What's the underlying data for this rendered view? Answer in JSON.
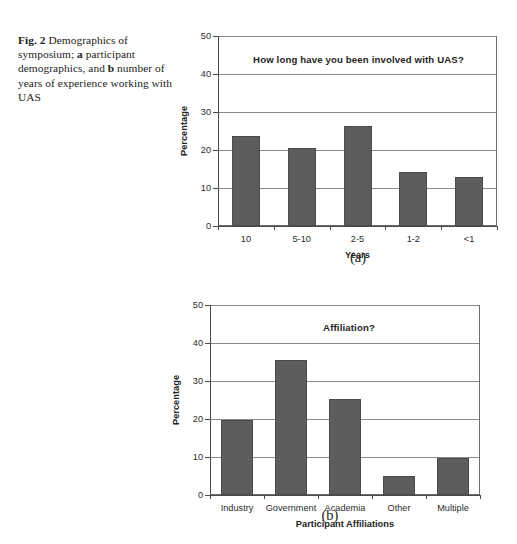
{
  "figure": {
    "caption_number": "Fig. 2",
    "caption_part1": "Demographics of symposium; ",
    "caption_a_letter": "a",
    "caption_part2": " participant demographics, and ",
    "caption_b_letter": "b",
    "caption_part3": " number of years of experience working with UAS",
    "bar_color": "#5d5d5d",
    "axis_color": "#4a4a4a",
    "grid_color": "#8a8a8a"
  },
  "panel_a": {
    "label": "(a)"
  },
  "panel_b": {
    "label": "(b)"
  },
  "chart_data": [
    {
      "type": "bar",
      "title": "How long have you been involved with UAS?",
      "xlabel": "Years",
      "ylabel": "Percentage",
      "categories": [
        "10",
        "5-10",
        "2-5",
        "1-2",
        "<1"
      ],
      "values": [
        23.7,
        20.6,
        26.3,
        14.3,
        12.9
      ],
      "yticks": [
        0,
        10,
        20,
        30,
        40,
        50
      ],
      "ylim": [
        0,
        50
      ],
      "grid": true,
      "legend": "none",
      "panel": "(a)"
    },
    {
      "type": "bar",
      "title": "Affiliation?",
      "xlabel": "Participant Affiliations",
      "ylabel": "Percentage",
      "categories": [
        "Industry",
        "Government",
        "Academia",
        "Other",
        "Multiple"
      ],
      "values": [
        19.7,
        35.5,
        25.2,
        5.0,
        9.8
      ],
      "yticks": [
        0,
        10,
        20,
        30,
        40,
        50
      ],
      "ylim": [
        0,
        50
      ],
      "grid": true,
      "legend": "none",
      "panel": "(b)"
    }
  ]
}
